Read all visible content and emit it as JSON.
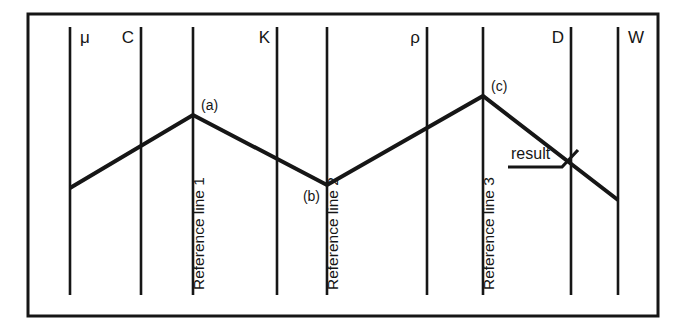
{
  "figure": {
    "type": "nomogram",
    "title": "",
    "background_color": "#ffffff",
    "ink_color": "#161616",
    "frame": {
      "name": "outer-border",
      "x": 28,
      "y": 14,
      "width": 630,
      "height": 302,
      "stroke_width": 3
    }
  },
  "axes": [
    {
      "id": "mu",
      "label": "μ",
      "x": 70,
      "label_side": "right",
      "label_x": 80,
      "label_y": 43
    },
    {
      "id": "C",
      "label": "C",
      "x": 141,
      "label_side": "left",
      "label_x": 126,
      "label_y": 43
    },
    {
      "id": "ref1",
      "label": "",
      "x": 193,
      "label_side": "none",
      "label_x": 0,
      "label_y": 0
    },
    {
      "id": "K",
      "label": "K",
      "x": 277,
      "label_side": "left",
      "label_x": 262,
      "label_y": 43
    },
    {
      "id": "ref2",
      "label": "",
      "x": 327,
      "label_side": "none",
      "label_x": 0,
      "label_y": 0
    },
    {
      "id": "rho",
      "label": "ρ",
      "x": 427,
      "label_side": "left",
      "label_x": 412,
      "label_y": 43
    },
    {
      "id": "ref3",
      "label": "",
      "x": 483,
      "label_side": "none",
      "label_x": 0,
      "label_y": 0
    },
    {
      "id": "D",
      "label": "D",
      "x": 571,
      "label_side": "left",
      "label_x": 556,
      "label_y": 43
    },
    {
      "id": "W",
      "label": "W",
      "x": 618,
      "label_side": "right",
      "label_x": 628,
      "label_y": 43
    }
  ],
  "axis_extent": {
    "top": 27,
    "bottom": 295,
    "stroke_width": 2.6
  },
  "reference_lines": [
    {
      "id": "ref1",
      "text": "Reference line 1",
      "x": 204,
      "y": 290,
      "rotation": -90
    },
    {
      "id": "ref2",
      "text": "Reference line 2",
      "x": 338,
      "y": 290,
      "rotation": -90
    },
    {
      "id": "ref3",
      "text": "Reference line 3",
      "x": 494,
      "y": 290,
      "rotation": -90
    }
  ],
  "construction_path": {
    "name": "construction-polyline",
    "stroke_width": 4,
    "points": [
      {
        "x": 70,
        "y": 188
      },
      {
        "x": 193,
        "y": 115
      },
      {
        "x": 327,
        "y": 185
      },
      {
        "x": 483,
        "y": 96
      },
      {
        "x": 618,
        "y": 200
      }
    ]
  },
  "point_labels": [
    {
      "id": "a",
      "text": "(a)",
      "anchor_x": 193,
      "anchor_y": 115,
      "label_x": 201,
      "label_y": 110
    },
    {
      "id": "b",
      "text": "(b)",
      "anchor_x": 327,
      "anchor_y": 185,
      "label_x": 299,
      "label_y": 201
    },
    {
      "id": "c",
      "text": "(c)",
      "anchor_x": 483,
      "anchor_y": 96,
      "label_x": 491,
      "label_y": 91
    }
  ],
  "annotation": {
    "name": "result-callout",
    "text": "result",
    "text_x": 511,
    "text_y": 159,
    "leader": {
      "underline_start_x": 508,
      "underline_end_x": 562,
      "underline_y": 167,
      "elbow_x": 575,
      "elbow_y": 152
    }
  }
}
